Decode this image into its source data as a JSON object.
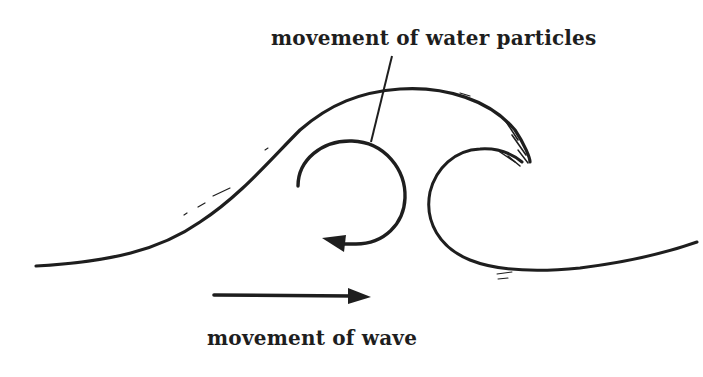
{
  "diagram": {
    "labels": {
      "particles": "movement of water particles",
      "wave": "movement of wave"
    },
    "elements": {
      "wave_profile": "breaking wave outline with curling crest",
      "particle_orbit": "circular arrow showing orbital motion of water particles (counter-clockwise arrowhead at lower left)",
      "leader_line": "line connecting particle label to orbit circle",
      "wave_direction_arrow": "horizontal arrow pointing right"
    },
    "colors": {
      "ink": "#1e1e1e",
      "background": "#ffffff"
    }
  }
}
